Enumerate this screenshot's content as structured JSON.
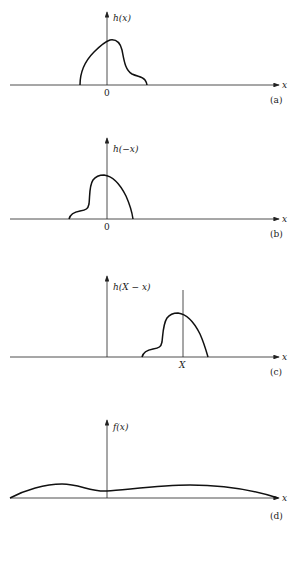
{
  "panels": [
    {
      "id": "a",
      "ylabel": "h(x)",
      "xlabel": "x",
      "origin_label": "0",
      "caption": "(a)"
    },
    {
      "id": "b",
      "ylabel": "h(−x)",
      "xlabel": "x",
      "origin_label": "0",
      "caption": "(b)"
    },
    {
      "id": "c",
      "ylabel": "h(X − x)",
      "xlabel": "x",
      "marker_label": "X",
      "caption": "(c)"
    },
    {
      "id": "d",
      "ylabel": "f(x)",
      "xlabel": "x",
      "caption": "(d)"
    }
  ],
  "colors": {
    "line": "#111111",
    "background": "#ffffff"
  }
}
